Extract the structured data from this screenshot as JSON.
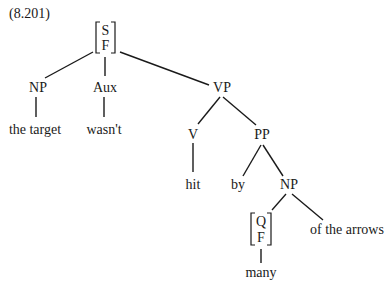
{
  "example_number": "(8.201)",
  "tree": {
    "root": {
      "features": [
        "S",
        "F"
      ]
    },
    "nodes": {
      "np_subject": "NP",
      "aux": "Aux",
      "vp": "VP",
      "v": "V",
      "pp": "PP",
      "np_object": "NP",
      "quantifier": {
        "features": [
          "Q",
          "F"
        ]
      }
    },
    "leaves": {
      "np_subject": "the target",
      "aux": "wasn't",
      "v": "hit",
      "p": "by",
      "quantifier": "many",
      "np_rest": "of the arrows"
    }
  }
}
